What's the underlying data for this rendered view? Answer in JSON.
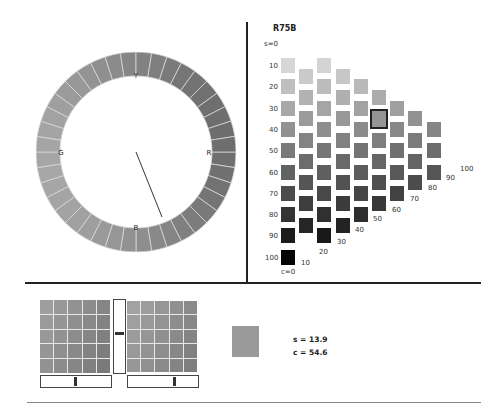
{
  "hue_wheel": {
    "segments": 40,
    "labels": {
      "top": "Y",
      "right": "R",
      "bottom": "B",
      "left": "G"
    },
    "needle": {
      "from": [
        136,
        152
      ],
      "to": [
        162,
        217
      ]
    }
  },
  "grid": {
    "title": "R75B",
    "s_axis_label": "s=0",
    "s_labels": [
      "10",
      "20",
      "30",
      "40",
      "50",
      "60",
      "70",
      "80",
      "90",
      "100"
    ],
    "c_axis_label": "c=0",
    "c_labels": [
      "10",
      "20",
      "30",
      "40",
      "50",
      "60",
      "70",
      "80",
      "90",
      "100"
    ],
    "selected": {
      "c": 50,
      "s": 35
    }
  },
  "bottom": {
    "left_slider_thumb_pct": 47,
    "right_slider_thumb_pct": 64,
    "vertical_slider_thumb_pct": 44,
    "sample_color": "#9a9a9a",
    "s_readout": "s = 13.9",
    "c_readout": "c = 54.6"
  }
}
